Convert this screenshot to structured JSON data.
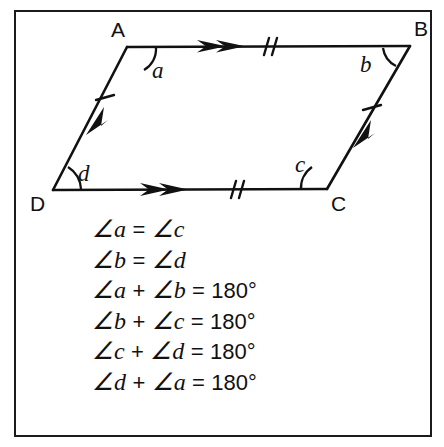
{
  "figure": {
    "border_color": "#1b1b1b",
    "line_color": "#111111",
    "background": "#ffffff",
    "vertices": [
      {
        "name": "A",
        "label": "A",
        "x": 127,
        "y": 47,
        "label_x": 118,
        "label_y": 37
      },
      {
        "name": "B",
        "label": "B",
        "x": 410,
        "y": 46,
        "label_x": 414,
        "label_y": 36
      },
      {
        "name": "C",
        "label": "C",
        "x": 327,
        "y": 189,
        "label_x": 331,
        "label_y": 211
      },
      {
        "name": "D",
        "label": "D",
        "x": 53,
        "y": 190,
        "label_x": 30,
        "label_y": 211
      }
    ],
    "angle_labels": [
      {
        "name": "a",
        "label": "a",
        "x": 152,
        "y": 78,
        "at_vertex": "A"
      },
      {
        "name": "b",
        "label": "b",
        "x": 360,
        "y": 72,
        "at_vertex": "B"
      },
      {
        "name": "c",
        "label": "c",
        "x": 295,
        "y": 172,
        "at_vertex": "C"
      },
      {
        "name": "d",
        "label": "d",
        "x": 78,
        "y": 181,
        "at_vertex": "D"
      }
    ],
    "side_marks": {
      "AB": {
        "arrows": 2,
        "ticks": 2
      },
      "DC": {
        "arrows": 2,
        "ticks": 2
      },
      "DA": {
        "arrows": 1,
        "ticks": 1
      },
      "CB": {
        "arrows": 1,
        "ticks": 1
      }
    }
  },
  "equations": [
    {
      "id": "eq-a-eq-c",
      "parts": [
        {
          "type": "angle",
          "text": "∠a"
        },
        {
          "type": "operator",
          "text": "="
        },
        {
          "type": "angle",
          "text": "∠c"
        }
      ],
      "plain": "∠a = ∠c"
    },
    {
      "id": "eq-b-eq-d",
      "parts": [
        {
          "type": "angle",
          "text": "∠b"
        },
        {
          "type": "operator",
          "text": "="
        },
        {
          "type": "angle",
          "text": "∠d"
        }
      ],
      "plain": "∠b = ∠d"
    },
    {
      "id": "eq-a-plus-b",
      "parts": [
        {
          "type": "angle",
          "text": "∠a"
        },
        {
          "type": "operator",
          "text": "+"
        },
        {
          "type": "angle",
          "text": "∠b"
        },
        {
          "type": "operator",
          "text": "="
        },
        {
          "type": "value",
          "text": "180°"
        }
      ],
      "plain": "∠a + ∠b = 180°"
    },
    {
      "id": "eq-b-plus-c",
      "parts": [
        {
          "type": "angle",
          "text": "∠b"
        },
        {
          "type": "operator",
          "text": "+"
        },
        {
          "type": "angle",
          "text": "∠c"
        },
        {
          "type": "operator",
          "text": "="
        },
        {
          "type": "value",
          "text": "180°"
        }
      ],
      "plain": "∠b + ∠c = 180°"
    },
    {
      "id": "eq-c-plus-d",
      "parts": [
        {
          "type": "angle",
          "text": "∠c"
        },
        {
          "type": "operator",
          "text": "+"
        },
        {
          "type": "angle",
          "text": "∠d"
        },
        {
          "type": "operator",
          "text": "="
        },
        {
          "type": "value",
          "text": "180°"
        }
      ],
      "plain": "∠c + ∠d = 180°"
    },
    {
      "id": "eq-d-plus-a",
      "parts": [
        {
          "type": "angle",
          "text": "∠d"
        },
        {
          "type": "operator",
          "text": "+"
        },
        {
          "type": "angle",
          "text": "∠a"
        },
        {
          "type": "operator",
          "text": "="
        },
        {
          "type": "value",
          "text": "180°"
        }
      ],
      "plain": "∠d + ∠a = 180°"
    }
  ]
}
